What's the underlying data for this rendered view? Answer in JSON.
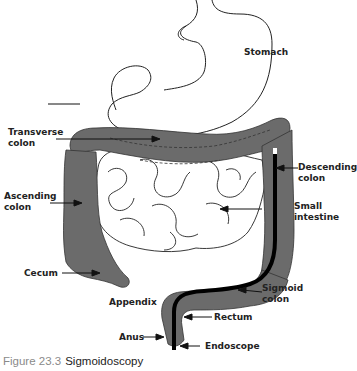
{
  "figure": {
    "number": "Figure 23.3",
    "title": "Sigmoidoscopy"
  },
  "labels": {
    "stomach": "Stomach",
    "transverse_colon": "Transverse\ncolon",
    "descending_colon": "Descending\ncolon",
    "ascending_colon": "Ascending\ncolon",
    "small_intestine": "Small\nintestine",
    "cecum": "Cecum",
    "sigmoid_colon": "Sigmoid\ncolon",
    "appendix": "Appendix",
    "rectum": "Rectum",
    "anus": "Anus",
    "endoscope": "Endoscope"
  },
  "colors": {
    "colon_fill": "#6b6b6b",
    "outline": "#222222",
    "endoscope": "#000000",
    "caption_number": "#8a8a8a"
  }
}
